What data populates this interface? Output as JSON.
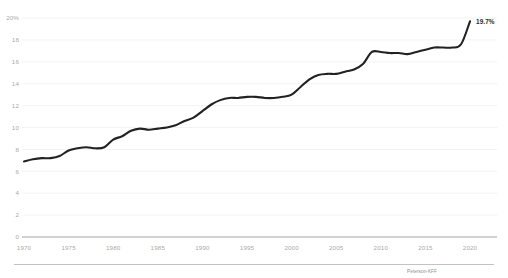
{
  "chart_data": {
    "type": "line",
    "title": "",
    "subtitle": "",
    "xlabel": "",
    "ylabel": "",
    "source": "Peterson-KFF",
    "grid": "horizontal",
    "legend": "none",
    "xlim": [
      1970,
      2020
    ],
    "ylim": [
      0,
      20
    ],
    "ytick_labels": [
      "20%",
      "18",
      "16",
      "14",
      "12",
      "10",
      "8",
      "6",
      "4",
      "2",
      "0"
    ],
    "ytick_values": [
      20,
      18,
      16,
      14,
      12,
      10,
      8,
      6,
      4,
      2,
      0
    ],
    "xtick_labels": [
      "1970",
      "1975",
      "1980",
      "1985",
      "1990",
      "1995",
      "2000",
      "2005",
      "2010",
      "2015",
      "2020"
    ],
    "xtick_values": [
      1970,
      1975,
      1980,
      1985,
      1990,
      1995,
      2000,
      2005,
      2010,
      2015,
      2020
    ],
    "endpoint_annotation": "19.7%",
    "series": [
      {
        "name": "Health spending share of GDP",
        "x": [
          1970,
          1971,
          1972,
          1973,
          1974,
          1975,
          1976,
          1977,
          1978,
          1979,
          1980,
          1981,
          1982,
          1983,
          1984,
          1985,
          1986,
          1987,
          1988,
          1989,
          1990,
          1991,
          1992,
          1993,
          1994,
          1995,
          1996,
          1997,
          1998,
          1999,
          2000,
          2001,
          2002,
          2003,
          2004,
          2005,
          2006,
          2007,
          2008,
          2009,
          2010,
          2011,
          2012,
          2013,
          2014,
          2015,
          2016,
          2017,
          2018,
          2019,
          2020
        ],
        "values": [
          6.9,
          7.1,
          7.2,
          7.2,
          7.4,
          7.9,
          8.1,
          8.2,
          8.1,
          8.2,
          8.9,
          9.2,
          9.7,
          9.9,
          9.8,
          9.9,
          10.0,
          10.2,
          10.6,
          10.9,
          11.5,
          12.1,
          12.5,
          12.7,
          12.7,
          12.8,
          12.8,
          12.7,
          12.7,
          12.8,
          13.0,
          13.7,
          14.4,
          14.8,
          14.9,
          14.9,
          15.1,
          15.3,
          15.8,
          16.9,
          16.9,
          16.8,
          16.8,
          16.7,
          16.9,
          17.1,
          17.3,
          17.3,
          17.3,
          17.6,
          19.7
        ]
      }
    ]
  },
  "colors": {
    "line": "#222222",
    "grid": "#eeeeee",
    "axis": "#9a9a9a",
    "tick_text": "#aaaaaa",
    "annotation_text": "#2b2b2b",
    "source_text": "#8d8d8d",
    "background": "#ffffff"
  }
}
